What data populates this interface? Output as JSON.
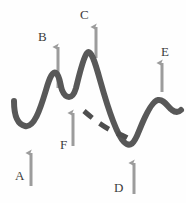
{
  "figure": {
    "width": 186,
    "height": 203,
    "background_color": "#fefefe",
    "curve": {
      "name": "main-curve",
      "stroke_color": "#585858",
      "stroke_width": 6,
      "style": "solid hand-drawn",
      "path": "M 14 101 C 14 111, 16 124, 25 126 C 34 128, 40 110, 46 90 C 50 76, 53 71, 56 73 C 60 76, 60 85, 62 90 C 64 95, 66 97, 69 97 C 72 97, 74 95, 76 88 C 79 76, 83 58, 87 53 C 91 49, 95 62, 100 80 C 107 105, 116 134, 124 142 C 130 148, 134 144, 139 131 C 145 116, 152 101, 158 100 C 164 99, 167 106, 172 110 C 176 113, 179 112, 181 110"
    },
    "dashed_segment": {
      "name": "dashed-curve-segment",
      "stroke_color": "#4e4e4e",
      "stroke_width": 5,
      "style": "dashed",
      "dash_pattern": "11 9",
      "path": "M 84 111 C 92 118, 102 126, 114 132 C 120 134, 126 137, 131 140"
    },
    "arrow_color": "#9c9c9c",
    "arrow_shaft_width": 3,
    "label_color": "#3c3c3c",
    "label_font_size": 13,
    "annotations": [
      {
        "id": "A",
        "label": "A",
        "label_x": 15,
        "label_y": 169,
        "arrow": {
          "x": 31,
          "y_tail": 186,
          "y_head": 148,
          "direction": "up"
        },
        "description": "arrow pointing up to first valley of the curve"
      },
      {
        "id": "B",
        "label": "B",
        "label_x": 38,
        "label_y": 30,
        "arrow": {
          "x": 58,
          "y_tail": 88,
          "y_head": 42,
          "direction": "up"
        },
        "description": "arrow pointing up to the first peak of the curve"
      },
      {
        "id": "C",
        "label": "C",
        "label_x": 80,
        "label_y": 8,
        "arrow": {
          "x": 96,
          "y_tail": 58,
          "y_head": 22,
          "direction": "up"
        },
        "description": "arrow pointing up to the tallest peak of the curve"
      },
      {
        "id": "D",
        "label": "D",
        "label_x": 114,
        "label_y": 181,
        "arrow": {
          "x": 134,
          "y_tail": 194,
          "y_head": 158,
          "direction": "up"
        },
        "description": "arrow pointing up to the deepest valley of the curve"
      },
      {
        "id": "E",
        "label": "E",
        "label_x": 161,
        "label_y": 45,
        "arrow": {
          "x": 162,
          "y_tail": 92,
          "y_head": 58,
          "direction": "up"
        },
        "description": "arrow pointing up to the last peak of the curve"
      },
      {
        "id": "F",
        "label": "F",
        "label_x": 60,
        "label_y": 138,
        "arrow": {
          "x": 73,
          "y_tail": 146,
          "y_head": 108,
          "direction": "up"
        },
        "description": "arrow pointing up to the small shoulder/hook between peaks"
      }
    ]
  }
}
